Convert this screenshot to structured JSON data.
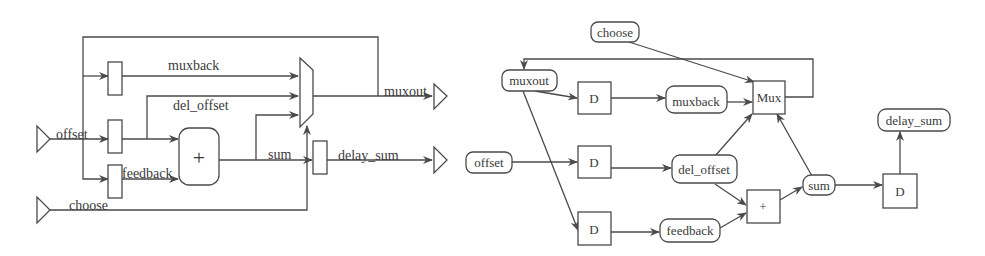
{
  "circuit": {
    "inputs": {
      "offset": "offset",
      "choose": "choose"
    },
    "outputs": {
      "muxout": "muxout",
      "delay_sum": "delay_sum"
    },
    "signals": {
      "muxback": "muxback",
      "del_offset": "del_offset",
      "feedback": "feedback",
      "sum": "sum"
    },
    "adder_symbol": "+"
  },
  "graph": {
    "nodes": {
      "choose": "choose",
      "muxout": "muxout",
      "offset": "offset",
      "muxback": "muxback",
      "del_offset": "del_offset",
      "feedback": "feedback",
      "sum": "sum",
      "delay_sum": "delay_sum",
      "mux": "Mux",
      "adder": "+",
      "delay": "D"
    }
  }
}
